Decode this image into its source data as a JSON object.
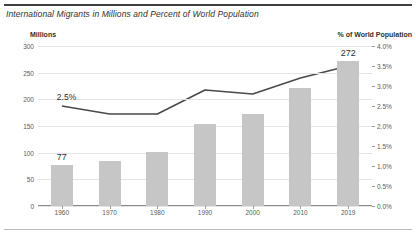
{
  "figure": {
    "title": "International Migrants in Millions and Percent of World Population",
    "left_axis_title": "Millions",
    "right_axis_title": "% of World Population"
  },
  "chart_data": {
    "type": "bar",
    "title": "International Migrants in Millions and Percent of World Population",
    "xlabel": "",
    "ylabel": "Millions",
    "y2label": "% of World Population",
    "categories": [
      "1960",
      "1970",
      "1980",
      "1990",
      "2000",
      "2010",
      "2019"
    ],
    "series": [
      {
        "name": "Millions",
        "type": "bar",
        "axis": "left",
        "values": [
          77,
          85,
          102,
          153,
          173,
          221,
          272
        ],
        "color": "#c6c6c6",
        "labels": {
          "1960": "77",
          "2019": "272"
        }
      },
      {
        "name": "% of World Population",
        "type": "line",
        "axis": "right",
        "values": [
          2.5,
          2.3,
          2.3,
          2.9,
          2.8,
          3.2,
          3.5
        ],
        "color": "#4a4a4a",
        "labels": {
          "1960": "2.5%"
        }
      }
    ],
    "ylim": [
      0,
      300
    ],
    "yticks": [
      "0",
      "50",
      "100",
      "150",
      "200",
      "250",
      "300"
    ],
    "y2lim": [
      0,
      4.0
    ],
    "y2ticks": [
      "0.0%",
      "0.5%",
      "1.0%",
      "1.5%",
      "2.0%",
      "2.5%",
      "3.0%",
      "3.5%",
      "4.0%"
    ],
    "grid": true,
    "legend": "none"
  }
}
